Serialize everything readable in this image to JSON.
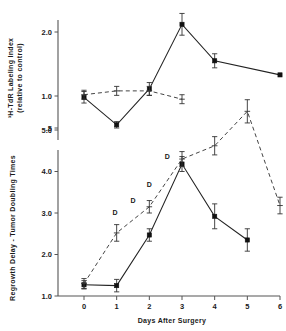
{
  "figure": {
    "background_color": "#ffffff",
    "foreground_color": "#1a1a1a"
  },
  "chart_data": [
    {
      "panel": "top",
      "type": "line",
      "title": "",
      "xlabel": "",
      "ylabel": "3H-TdR Labeling Index (relative to control)",
      "ylabel_line1": "³H-TdR Labeling Index",
      "ylabel_line2": "(relative to control)",
      "x": [
        0,
        1,
        2,
        3,
        4,
        6
      ],
      "xlim": [
        0,
        6
      ],
      "ylim": [
        0.35,
        2.45
      ],
      "ytick_values": [
        0.5,
        1.0,
        2.0
      ],
      "ytick_labels": [
        ".5",
        "1.0",
        "2.0"
      ],
      "grid": false,
      "legend": "none",
      "series": [
        {
          "name": "solid-filled-square",
          "marker": "filled-square",
          "linestyle": "solid",
          "x": [
            0,
            1,
            2,
            3,
            4,
            6
          ],
          "values": [
            0.98,
            0.55,
            1.11,
            2.12,
            1.55,
            1.33
          ],
          "errors": [
            0.09,
            0.05,
            0.1,
            0.17,
            0.11,
            0.0
          ]
        },
        {
          "name": "dashed-open-marker",
          "marker": "open",
          "linestyle": "dashed",
          "x": [
            0,
            1,
            2,
            3
          ],
          "values": [
            1.02,
            1.08,
            1.08,
            0.95
          ],
          "errors": [
            0.07,
            0.07,
            0.07,
            0.07
          ]
        }
      ]
    },
    {
      "panel": "bottom",
      "type": "line",
      "title": "",
      "xlabel": "Days After Surgery",
      "ylabel": "Regrowth Delay - Tumor Doubling Times",
      "x": [
        0,
        1,
        2,
        3,
        4,
        5,
        6
      ],
      "xtick_labels": [
        "0",
        "1",
        "2",
        "3",
        "4",
        "5",
        "6"
      ],
      "xlim": [
        0,
        6
      ],
      "ylim": [
        1.0,
        5.7
      ],
      "ytick_values": [
        1.0,
        2.0,
        3.0,
        4.0,
        5.0
      ],
      "ytick_labels": [
        "1.0",
        "2.0",
        "3.0",
        "4.0",
        "5.0"
      ],
      "grid": false,
      "legend": "none",
      "annotations": [
        {
          "text": "D",
          "x": 0.95,
          "y": 2.95
        },
        {
          "text": "D",
          "x": 1.5,
          "y": 3.25
        },
        {
          "text": "D",
          "x": 2.0,
          "y": 3.62
        },
        {
          "text": "D",
          "x": 2.55,
          "y": 4.3
        }
      ],
      "series": [
        {
          "name": "solid-filled-square",
          "marker": "filled-square",
          "linestyle": "solid",
          "x": [
            0,
            1,
            2,
            3,
            4,
            5
          ],
          "values": [
            1.27,
            1.25,
            2.47,
            4.18,
            2.92,
            2.35
          ],
          "errors": [
            0.1,
            0.15,
            0.15,
            0.18,
            0.3,
            0.27
          ]
        },
        {
          "name": "dashed-open-marker",
          "marker": "open",
          "linestyle": "dashed",
          "x": [
            0,
            1,
            2,
            3,
            4,
            5,
            6
          ],
          "values": [
            1.3,
            2.52,
            3.15,
            4.3,
            4.62,
            5.45,
            3.18
          ],
          "errors": [
            0.12,
            0.2,
            0.15,
            0.18,
            0.22,
            0.28,
            0.2
          ]
        }
      ]
    }
  ]
}
